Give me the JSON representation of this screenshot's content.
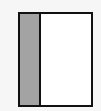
{
  "diagram": {
    "type": "two-panel layout",
    "colors": {
      "background": "#f6f6f6",
      "border": "#111111",
      "left_panel": "#a3a3a3",
      "right_panel": "#ffffff"
    },
    "panels": [
      {
        "id": "left",
        "fill": "#a3a3a3",
        "label": ""
      },
      {
        "id": "right",
        "fill": "#ffffff",
        "label": ""
      }
    ]
  }
}
